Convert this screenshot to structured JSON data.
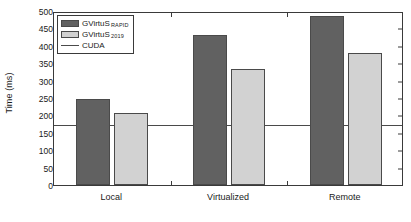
{
  "chart_data": {
    "type": "bar",
    "title": "",
    "xlabel": "",
    "ylabel": "Time (ms)",
    "ylim": [
      0,
      500
    ],
    "yticks": [
      0,
      50,
      100,
      150,
      200,
      250,
      300,
      350,
      400,
      450,
      500
    ],
    "grid": false,
    "legend_position": "upper-left",
    "categories": [
      "Local",
      "Virtualized",
      "Remote"
    ],
    "series": [
      {
        "name": "GVirtuS",
        "name_sub": "RAPID",
        "color": "#616161",
        "values": [
          247,
          430,
          487
        ]
      },
      {
        "name": "GVirtuS",
        "name_sub": "2019",
        "color": "#d2d2d2",
        "values": [
          206,
          333,
          378
        ]
      }
    ],
    "reference_line": {
      "label": "CUDA",
      "value": 178,
      "color": "#4a4a4a"
    }
  }
}
